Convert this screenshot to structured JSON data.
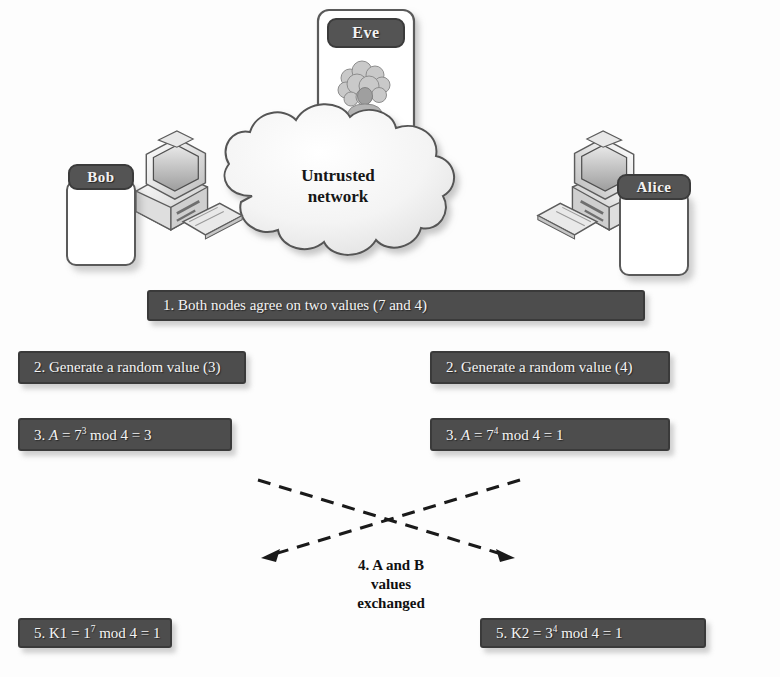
{
  "figure": {
    "caption": ""
  },
  "network": {
    "label_line1": "Untrusted",
    "label_line2": "network",
    "icon": "cloud-icon"
  },
  "actors": [
    {
      "id": "bob",
      "name": "Bob",
      "icon": "bob-avatar-icon"
    },
    {
      "id": "eve",
      "name": "Eve",
      "icon": "eve-avatar-icon"
    },
    {
      "id": "alice",
      "name": "Alice",
      "icon": "alice-avatar-icon"
    }
  ],
  "devices": [
    {
      "id": "bob-computer",
      "icon": "desktop-computer-icon"
    },
    {
      "id": "alice-computer",
      "icon": "desktop-computer-icon"
    }
  ],
  "steps": {
    "step1": {
      "id": "step-1",
      "text": "1. Both nodes agree on two values (7 and 4)"
    },
    "step2_left": {
      "id": "step-2-left",
      "text": "2. Generate a random value (3)"
    },
    "step2_right": {
      "id": "step-2-right",
      "text": "2. Generate a random value (4)"
    },
    "step3_left": {
      "id": "step-3-left",
      "prefix": "3. ",
      "var": "A",
      "eq1": " = 7",
      "exp": "3",
      "suffix": " mod 4 = 3"
    },
    "step3_right": {
      "id": "step-3-right",
      "prefix": "3. ",
      "var": "A",
      "eq1": " = 7",
      "exp": "4",
      "suffix": " mod 4 = 1"
    },
    "step4": {
      "id": "step-4",
      "line1": "4. A and B",
      "line2": "values",
      "line3": "exchanged"
    },
    "step5_left": {
      "id": "step-5-left",
      "prefix": "5. K1 = 1",
      "exp": "7",
      "suffix": " mod 4 = 1"
    },
    "step5_right": {
      "id": "step-5-right",
      "prefix": "5. K2 = 3",
      "exp": "4",
      "suffix": " mod 4 = 1"
    }
  },
  "arrows": {
    "left_arrow_label": "exchange-arrow-left",
    "right_arrow_label": "exchange-arrow-right",
    "style": "dashed"
  },
  "colors": {
    "bar_fill": "#4d4d4d",
    "bar_border": "#3a3a3a",
    "bar_text": "#f4f4f4",
    "name_fill": "#545454",
    "card_border": "#5a5a5a",
    "arrow": "#1a1a1a",
    "background": "#fdfdfd"
  }
}
